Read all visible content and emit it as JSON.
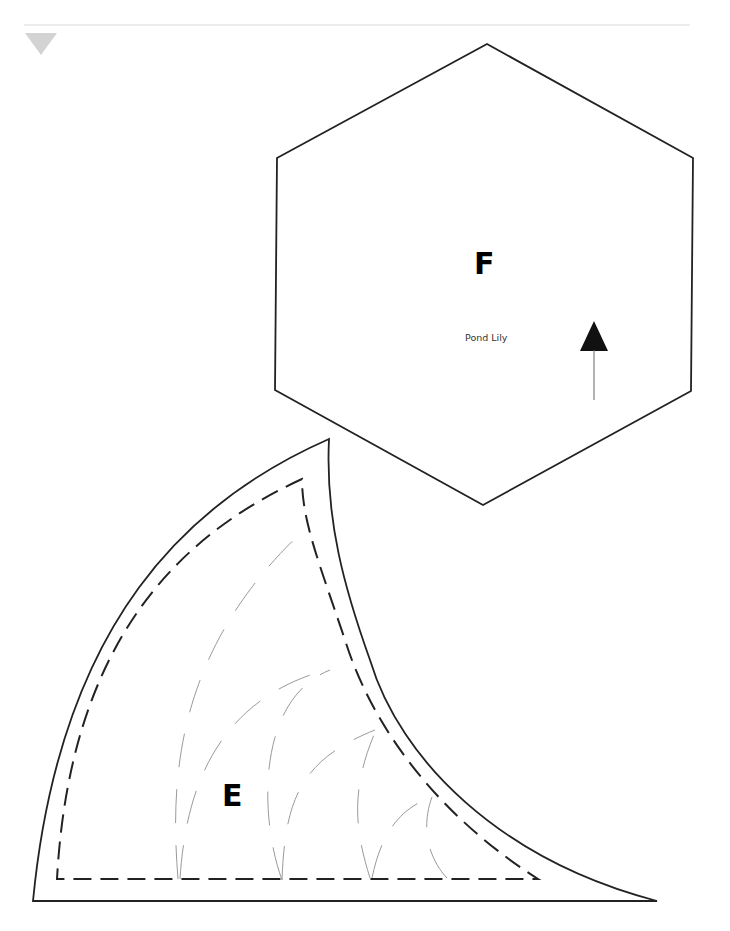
{
  "page": {
    "marker": "down-triangle-marker",
    "rule_color": "#ececec",
    "marker_color": "#d3d3d3"
  },
  "pieces": {
    "hexagon": {
      "letter": "F",
      "name": "Pond Lily",
      "grain_arrow": "up-arrow-icon",
      "stroke": "#222222"
    },
    "wedge": {
      "letter": "E",
      "seam_line": "dashed",
      "quilting_lines_color": "#9a9a9a",
      "stroke": "#222222"
    }
  }
}
